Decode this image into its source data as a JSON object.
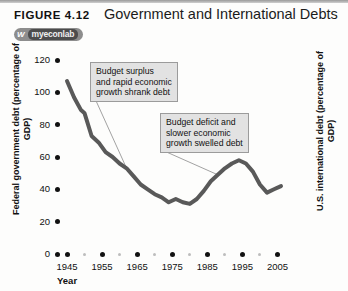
{
  "figure": {
    "label": "FIGURE 4.12",
    "title": "Government and International Debts",
    "badge_w": "W",
    "badge_text": "myeconlab"
  },
  "chart_data": {
    "type": "line",
    "title": "Government and International Debts",
    "xlabel": "Year",
    "ylabel": "Federal government debt (percentage of GDP)",
    "ylabel_right": "U.S. international debt (percentage of GDP)",
    "xlim": [
      1943,
      2008
    ],
    "ylim": [
      0,
      120
    ],
    "yticks": [
      0,
      20,
      40,
      60,
      80,
      100,
      120
    ],
    "xticks": [
      1945,
      1955,
      1965,
      1975,
      1985,
      1995,
      2005
    ],
    "grid": false,
    "legend": "none",
    "series": [
      {
        "name": "Federal government debt (percentage of GDP)",
        "color": "#595959",
        "x": [
          1945,
          1947,
          1949,
          1950,
          1952,
          1954,
          1956,
          1958,
          1960,
          1962,
          1964,
          1966,
          1968,
          1970,
          1972,
          1974,
          1976,
          1978,
          1980,
          1982,
          1984,
          1986,
          1988,
          1990,
          1992,
          1994,
          1996,
          1998,
          2000,
          2002,
          2004,
          2006
        ],
        "y": [
          107,
          97,
          89,
          87,
          73,
          69,
          63,
          60,
          56,
          53,
          48,
          43,
          40,
          37,
          35,
          32,
          34,
          32,
          31,
          34,
          39,
          45,
          49,
          53,
          56,
          58,
          56,
          51,
          43,
          38,
          40,
          42
        ]
      }
    ],
    "annotations": [
      {
        "id": "callout-1",
        "text": "Budget surplus\nand rapid economic\ngrowth shrank debt",
        "target_year": 1962
      },
      {
        "id": "callout-2",
        "text": "Budget deficit and\nslower economic\ngrowth swelled debt",
        "target_year": 1988
      }
    ]
  }
}
